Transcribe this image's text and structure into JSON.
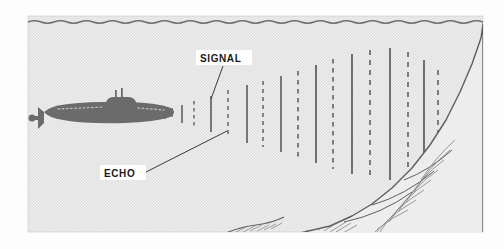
{
  "figure": {
    "panel": {
      "x": 28,
      "y": 16,
      "width": 455,
      "height": 216
    },
    "background_color": "#efefef",
    "panel_texture": "halftone-dots",
    "border_color": "#b8b8b8"
  },
  "water_surface": {
    "name": "water-surface-line",
    "color": "#6f6f6f",
    "y": 22,
    "amplitude": 1.8,
    "wavelength": 26
  },
  "submarine": {
    "name": "submarine",
    "hull_color": "#6b6b6b",
    "detail_color": "#a9a9a9",
    "x": 30,
    "y": 96,
    "length": 138,
    "height": 30,
    "parts": [
      "hull",
      "conning-tower",
      "periscope-mast-1",
      "periscope-mast-2",
      "stern-rudder",
      "deck-dots"
    ]
  },
  "labels": [
    {
      "id": "signal",
      "text": "SIGNAL",
      "box": {
        "x": 197,
        "y": 50,
        "width": 54,
        "height": 14
      },
      "leader": {
        "x1": 223,
        "y1": 65,
        "x2": 211,
        "y2": 99
      },
      "background": "#ffffff",
      "color": "#1a1a1a"
    },
    {
      "id": "echo",
      "text": "ECHO",
      "box": {
        "x": 101,
        "y": 168,
        "width": 44,
        "height": 14
      },
      "leader": {
        "x1": 146,
        "y1": 172,
        "x2": 227,
        "y2": 130
      },
      "background": "#ffffff",
      "color": "#1a1a1a"
    }
  ],
  "sonar_waves": {
    "name": "sonar-wave-lines",
    "solid_color": "#5a5a5a",
    "dashed_color": "#6a6a6a",
    "center_y": 114,
    "description": "Alternating solid SIGNAL lines and dashed ECHO lines, growing taller toward the rock face",
    "lines": [
      {
        "x": 165,
        "half_height": 5,
        "style": "solid"
      },
      {
        "x": 172,
        "half_height": 6,
        "style": "dashed"
      },
      {
        "x": 182,
        "half_height": 9,
        "style": "solid"
      },
      {
        "x": 194,
        "half_height": 13,
        "style": "dashed"
      },
      {
        "x": 211,
        "half_height": 18,
        "style": "solid"
      },
      {
        "x": 228,
        "half_height": 24,
        "style": "dashed"
      },
      {
        "x": 247,
        "half_height": 29,
        "style": "solid"
      },
      {
        "x": 263,
        "half_height": 33,
        "style": "dashed"
      },
      {
        "x": 281,
        "half_height": 38,
        "style": "solid"
      },
      {
        "x": 298,
        "half_height": 43,
        "style": "dashed"
      },
      {
        "x": 316,
        "half_height": 49,
        "style": "solid"
      },
      {
        "x": 333,
        "half_height": 55,
        "style": "dashed"
      },
      {
        "x": 352,
        "half_height": 60,
        "style": "solid"
      },
      {
        "x": 370,
        "half_height": 64,
        "style": "dashed"
      },
      {
        "x": 390,
        "half_height": 66,
        "style": "solid"
      },
      {
        "x": 408,
        "half_height": 62,
        "style": "dashed"
      },
      {
        "x": 424,
        "half_height": 54,
        "style": "solid"
      },
      {
        "x": 438,
        "half_height": 44,
        "style": "dashed"
      }
    ]
  },
  "seafloor": {
    "name": "rocky-seafloor-cliff",
    "line_color": "#5e5e5e",
    "hatch_color": "#7c7c7c",
    "description": "Steep rocky cliff rising from bottom-left to upper-right, drawn with line hatching"
  }
}
